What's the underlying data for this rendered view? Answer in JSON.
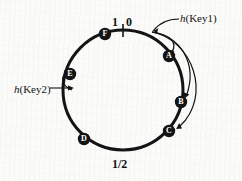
{
  "figure": {
    "background_color": "#fbfbfa",
    "ink_color": "#131313"
  },
  "ring": {
    "center_x": 123,
    "center_y": 90,
    "radius": 60,
    "stroke_width": 3,
    "origin_tick": {
      "label_left": "1",
      "label_right": "0",
      "angle_deg": 270
    }
  },
  "axis_labels": [
    {
      "name": "one",
      "text": "1",
      "position": "top-left-of-tick"
    },
    {
      "name": "zero",
      "text": "0",
      "position": "top-right-of-tick"
    },
    {
      "name": "half",
      "text": "1/2",
      "position": "bottom-center"
    }
  ],
  "nodes": [
    {
      "id": "A",
      "label": "A",
      "angle_deg": -55,
      "x": 169,
      "y": 56
    },
    {
      "id": "B",
      "label": "B",
      "angle_deg": -12,
      "x": 181,
      "y": 102
    },
    {
      "id": "C",
      "label": "C",
      "angle_deg": 22,
      "x": 169,
      "y": 131
    },
    {
      "id": "D",
      "label": "D",
      "angle_deg": 68,
      "x": 84,
      "y": 139
    },
    {
      "id": "E",
      "label": "E",
      "angle_deg": 160,
      "x": 70,
      "y": 74
    },
    {
      "id": "F",
      "label": "F",
      "angle_deg": 232,
      "x": 105,
      "y": 34
    }
  ],
  "annotations": [
    {
      "name": "key1",
      "text_plain": "h(Key1)",
      "italic_part": "h",
      "rest_part": "(Key1)",
      "points_to": "ring-position-of-key1",
      "targets": [
        "A",
        "B",
        "C"
      ]
    },
    {
      "name": "key2",
      "text_plain": "h(Key2)",
      "italic_part": "h",
      "rest_part": "(Key2)",
      "points_to": "ring-position-of-key2",
      "targets": [
        "E"
      ]
    }
  ],
  "arrows": {
    "key1_to_nodes": 3,
    "key2_to_nodes": 1,
    "description": "curved arrows from hashed key position clockwise to successor nodes"
  }
}
